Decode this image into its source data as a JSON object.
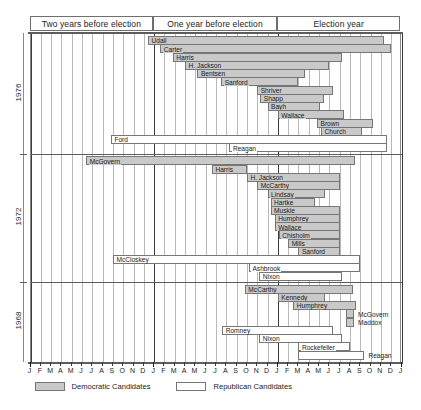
{
  "header": {
    "bands": [
      {
        "label": "Two years before election"
      },
      {
        "label": "One year before election"
      },
      {
        "label": "Election year"
      }
    ]
  },
  "axis": {
    "month_labels": [
      "J",
      "F",
      "M",
      "A",
      "M",
      "J",
      "J",
      "A",
      "S",
      "O",
      "N",
      "D",
      "J",
      "F",
      "M",
      "A",
      "M",
      "J",
      "J",
      "A",
      "S",
      "O",
      "N",
      "D",
      "J",
      "F",
      "M",
      "A",
      "M",
      "J",
      "J",
      "A",
      "S",
      "O",
      "N",
      "D",
      "J"
    ],
    "year_tick_indices": [
      0,
      12,
      24,
      36
    ]
  },
  "legend": {
    "items": [
      {
        "key": "dem",
        "label": "Democratic Candidates"
      },
      {
        "key": "rep",
        "label": "Republican Candidates"
      }
    ]
  },
  "chart_data": {
    "type": "bar",
    "title": "",
    "xlabel": "",
    "ylabel": "",
    "orientation": "horizontal",
    "note": "Gantt-style campaign duration timeline. x units = months from start of the period two years before the election (0) to January of the election year +12 (36).",
    "xlim": [
      0,
      36
    ],
    "grid": true,
    "legend_position": "bottom-left",
    "series": [
      {
        "name": "Democratic Candidates",
        "key": "dem",
        "color": "#c9c9c9"
      },
      {
        "name": "Republican Candidates",
        "key": "rep",
        "color": "#ffffff"
      }
    ],
    "groups": [
      {
        "year": "1976",
        "bars": [
          {
            "label": "Udall",
            "party": "dem",
            "start": 11.4,
            "end": 34.3,
            "label_outside": false
          },
          {
            "label": "Carter",
            "party": "dem",
            "start": 12.6,
            "end": 35.0,
            "label_outside": false
          },
          {
            "label": "Harris",
            "party": "dem",
            "start": 13.8,
            "end": 30.2,
            "label_outside": false
          },
          {
            "label": "H. Jackson",
            "party": "dem",
            "start": 15.0,
            "end": 29.0,
            "label_outside": false
          },
          {
            "label": "Bentsen",
            "party": "dem",
            "start": 16.2,
            "end": 26.6,
            "label_outside": false
          },
          {
            "label": "Sanford",
            "party": "dem",
            "start": 18.5,
            "end": 26.0,
            "label_outside": false
          },
          {
            "label": "Shriver",
            "party": "dem",
            "start": 22.0,
            "end": 29.4,
            "label_outside": false
          },
          {
            "label": "Shapp",
            "party": "dem",
            "start": 22.3,
            "end": 28.5,
            "label_outside": false
          },
          {
            "label": "Bayh",
            "party": "dem",
            "start": 23.0,
            "end": 28.1,
            "label_outside": false
          },
          {
            "label": "Wallace",
            "party": "dem",
            "start": 24.0,
            "end": 30.4,
            "label_outside": false
          },
          {
            "label": "Brown",
            "party": "dem",
            "start": 27.8,
            "end": 33.2,
            "label_outside": false
          },
          {
            "label": "Church",
            "party": "dem",
            "start": 28.2,
            "end": 32.2,
            "label_outside": false
          },
          {
            "label": "Ford",
            "party": "rep",
            "start": 7.8,
            "end": 34.6,
            "label_outside": false
          },
          {
            "label": "Reagan",
            "party": "rep",
            "start": 19.3,
            "end": 34.6,
            "label_outside": false
          }
        ]
      },
      {
        "year": "1972",
        "bars": [
          {
            "label": "McGovern",
            "party": "dem",
            "start": 5.4,
            "end": 31.5,
            "label_outside": false
          },
          {
            "label": "Harris",
            "party": "dem",
            "start": 17.6,
            "end": 21.0,
            "label_outside": false
          },
          {
            "label": "H. Jackson",
            "party": "dem",
            "start": 21.0,
            "end": 30.0,
            "label_outside": false
          },
          {
            "label": "McCarthy",
            "party": "dem",
            "start": 22.0,
            "end": 30.0,
            "label_outside": false
          },
          {
            "label": "Lindsay",
            "party": "dem",
            "start": 23.0,
            "end": 28.6,
            "label_outside": false
          },
          {
            "label": "Hartke",
            "party": "dem",
            "start": 23.3,
            "end": 27.6,
            "label_outside": false
          },
          {
            "label": "Muskie",
            "party": "dem",
            "start": 23.3,
            "end": 30.0,
            "label_outside": false
          },
          {
            "label": "Humphrey",
            "party": "dem",
            "start": 23.7,
            "end": 30.0,
            "label_outside": false
          },
          {
            "label": "Wallace",
            "party": "dem",
            "start": 23.7,
            "end": 30.0,
            "label_outside": false
          },
          {
            "label": "Chisholm",
            "party": "dem",
            "start": 24.1,
            "end": 30.0,
            "label_outside": false
          },
          {
            "label": "Mills",
            "party": "dem",
            "start": 25.0,
            "end": 30.0,
            "label_outside": false
          },
          {
            "label": "Sanford",
            "party": "dem",
            "start": 26.0,
            "end": 30.0,
            "label_outside": false
          },
          {
            "label": "McCloskey",
            "party": "rep",
            "start": 8.0,
            "end": 32.0,
            "label_outside": false
          },
          {
            "label": "Ashbrook",
            "party": "rep",
            "start": 21.2,
            "end": 32.0,
            "label_outside": false
          },
          {
            "label": "Nixon",
            "party": "rep",
            "start": 22.2,
            "end": 30.2,
            "label_outside": false
          }
        ]
      },
      {
        "year": "1968",
        "bars": [
          {
            "label": "McCarthy",
            "party": "dem",
            "start": 20.8,
            "end": 31.3,
            "label_outside": false
          },
          {
            "label": "Kennedy",
            "party": "dem",
            "start": 24.0,
            "end": 28.6,
            "label_outside": false
          },
          {
            "label": "Humphrey",
            "party": "dem",
            "start": 25.5,
            "end": 31.6,
            "label_outside": false
          },
          {
            "label": "McGovern",
            "party": "dem",
            "start": 30.6,
            "end": 31.4,
            "label_outside": true
          },
          {
            "label": "Maddox",
            "party": "dem",
            "start": 30.6,
            "end": 31.4,
            "label_outside": true
          },
          {
            "label": "Romney",
            "party": "rep",
            "start": 18.6,
            "end": 29.4,
            "label_outside": false
          },
          {
            "label": "Nixon",
            "party": "rep",
            "start": 22.2,
            "end": 30.2,
            "label_outside": false
          },
          {
            "label": "Rockefeller",
            "party": "rep",
            "start": 26.0,
            "end": 31.0,
            "label_outside": false
          },
          {
            "label": "Reagan",
            "party": "rep",
            "start": 26.0,
            "end": 32.4,
            "label_outside": true
          }
        ]
      }
    ]
  }
}
